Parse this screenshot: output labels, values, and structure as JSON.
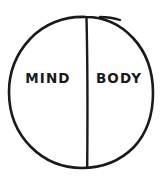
{
  "diagram": {
    "type": "venn-split-circle",
    "background_color": "#ffffff",
    "stroke_color": "#1a1a1a",
    "canvas": {
      "width": 165,
      "height": 179
    },
    "circle": {
      "center_x": 81,
      "center_y": 92,
      "radius_x": 72,
      "radius_y": 76,
      "stroke_width": 2.6,
      "style": "hand-drawn"
    },
    "divider": {
      "x": 87,
      "top_y": 17,
      "bottom_y": 167,
      "stroke_width": 2.4,
      "orientation": "vertical"
    },
    "pen_tail": {
      "description": "hand-drawn pen overshoot at top right of circle",
      "start_x": 101,
      "start_y": 17,
      "end_x": 120,
      "end_y": 20
    },
    "halves": [
      {
        "id": "left",
        "label": "MIND",
        "label_x": 48,
        "label_y": 79
      },
      {
        "id": "right",
        "label": "BODY",
        "label_x": 119,
        "label_y": 79
      }
    ]
  }
}
